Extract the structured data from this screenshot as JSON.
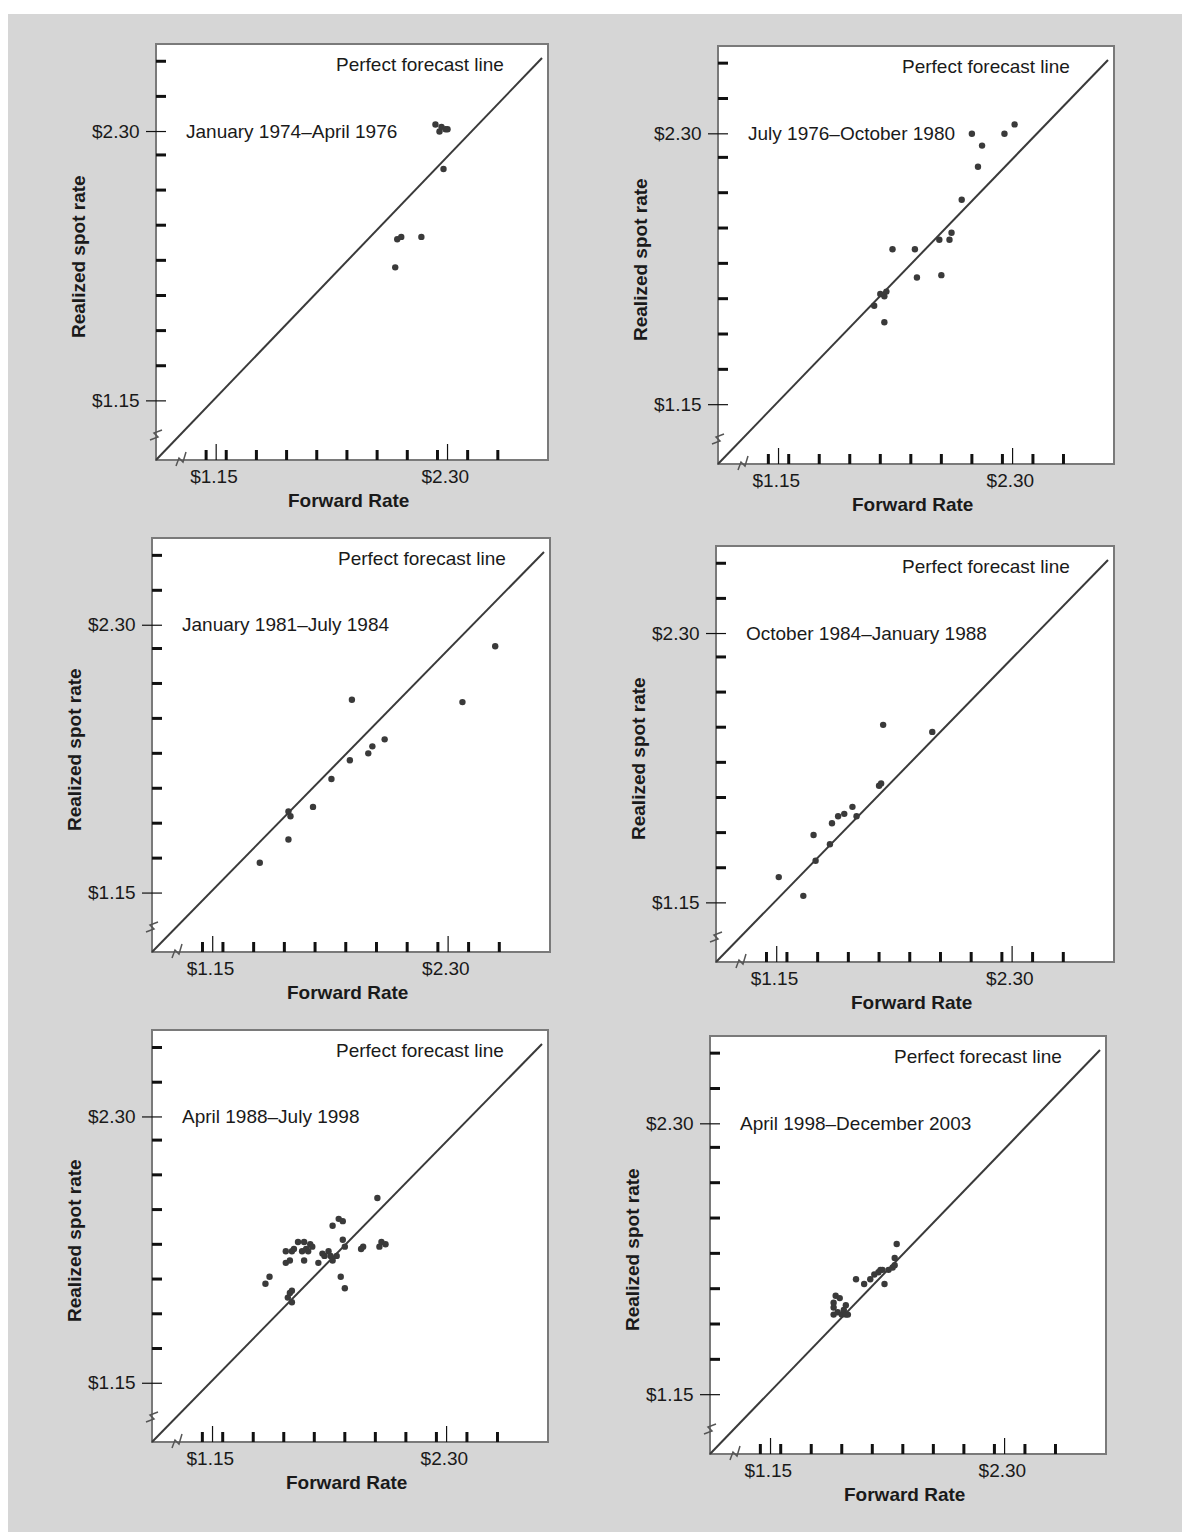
{
  "figure": {
    "background": "#d6d6d6",
    "plot_background": "#ffffff",
    "line_color": "#3a3a3a",
    "point_color": "#3a3a3a"
  },
  "labels": {
    "ylabel": "Realized spot rate",
    "xlabel": "Forward Rate",
    "line_label": "Perfect forecast line",
    "tick_low": "$1.15",
    "tick_high": "$2.30"
  },
  "chart_data": [
    {
      "type": "scatter",
      "title": "January 1974–April 1976",
      "xlabel": "Forward Rate",
      "ylabel": "Realized spot rate",
      "xticks": [
        "$1.15",
        "$2.30"
      ],
      "yticks": [
        "$1.15",
        "$2.30"
      ],
      "xlim": [
        0.9,
        2.8
      ],
      "ylim": [
        0.9,
        2.6
      ],
      "reference_line": {
        "label": "Perfect forecast line",
        "slope": 1,
        "intercept": 0
      },
      "points": [
        [
          2.04,
          1.72
        ],
        [
          2.05,
          1.84
        ],
        [
          2.07,
          1.85
        ],
        [
          2.17,
          1.85
        ],
        [
          2.24,
          2.33
        ],
        [
          2.26,
          2.3
        ],
        [
          2.27,
          2.32
        ],
        [
          2.29,
          2.31
        ],
        [
          2.3,
          2.31
        ],
        [
          2.28,
          2.14
        ]
      ]
    },
    {
      "type": "scatter",
      "title": "July 1976–October 1980",
      "xlabel": "Forward Rate",
      "ylabel": "Realized spot rate",
      "xticks": [
        "$1.15",
        "$2.30"
      ],
      "yticks": [
        "$1.15",
        "$2.30"
      ],
      "xlim": [
        0.9,
        2.8
      ],
      "ylim": [
        0.9,
        2.6
      ],
      "reference_line": {
        "label": "Perfect forecast line",
        "slope": 1,
        "intercept": 0
      },
      "points": [
        [
          1.62,
          1.57
        ],
        [
          1.65,
          1.62
        ],
        [
          1.67,
          1.61
        ],
        [
          1.68,
          1.63
        ],
        [
          1.67,
          1.5
        ],
        [
          1.71,
          1.81
        ],
        [
          1.82,
          1.81
        ],
        [
          1.83,
          1.69
        ],
        [
          1.94,
          1.85
        ],
        [
          1.95,
          1.7
        ],
        [
          1.99,
          1.85
        ],
        [
          2.0,
          1.88
        ],
        [
          2.05,
          2.02
        ],
        [
          2.1,
          2.3
        ],
        [
          2.13,
          2.16
        ],
        [
          2.15,
          2.25
        ],
        [
          2.26,
          2.3
        ],
        [
          2.31,
          2.34
        ]
      ]
    },
    {
      "type": "scatter",
      "title": "January 1981–July 1984",
      "xlabel": "Forward Rate",
      "ylabel": "Realized spot rate",
      "xticks": [
        "$1.15",
        "$2.30"
      ],
      "yticks": [
        "$1.15",
        "$2.30"
      ],
      "xlim": [
        0.9,
        2.8
      ],
      "ylim": [
        0.9,
        2.6
      ],
      "reference_line": {
        "label": "Perfect forecast line",
        "slope": 1,
        "intercept": 0
      },
      "points": [
        [
          1.38,
          1.28
        ],
        [
          1.52,
          1.38
        ],
        [
          1.52,
          1.5
        ],
        [
          1.53,
          1.48
        ],
        [
          1.64,
          1.52
        ],
        [
          1.73,
          1.64
        ],
        [
          1.82,
          1.72
        ],
        [
          1.83,
          1.98
        ],
        [
          1.91,
          1.75
        ],
        [
          1.93,
          1.78
        ],
        [
          1.99,
          1.81
        ],
        [
          2.37,
          1.97
        ],
        [
          2.53,
          2.21
        ]
      ]
    },
    {
      "type": "scatter",
      "title": "October 1984–January 1988",
      "xlabel": "Forward Rate",
      "ylabel": "Realized spot rate",
      "xticks": [
        "$1.15",
        "$2.30"
      ],
      "yticks": [
        "$1.15",
        "$2.30"
      ],
      "xlim": [
        0.9,
        2.8
      ],
      "ylim": [
        0.9,
        2.6
      ],
      "reference_line": {
        "label": "Perfect forecast line",
        "slope": 1,
        "intercept": 0
      },
      "points": [
        [
          1.16,
          1.26
        ],
        [
          1.28,
          1.18
        ],
        [
          1.33,
          1.44
        ],
        [
          1.34,
          1.33
        ],
        [
          1.41,
          1.4
        ],
        [
          1.42,
          1.49
        ],
        [
          1.45,
          1.52
        ],
        [
          1.48,
          1.53
        ],
        [
          1.52,
          1.56
        ],
        [
          1.54,
          1.52
        ],
        [
          1.65,
          1.65
        ],
        [
          1.66,
          1.66
        ],
        [
          1.67,
          1.91
        ],
        [
          1.91,
          1.88
        ]
      ]
    },
    {
      "type": "scatter",
      "title": "April 1988–July 1998",
      "xlabel": "Forward Rate",
      "ylabel": "Realized spot rate",
      "xticks": [
        "$1.15",
        "$2.30"
      ],
      "yticks": [
        "$1.15",
        "$2.30"
      ],
      "xlim": [
        0.9,
        2.8
      ],
      "ylim": [
        0.9,
        2.6
      ],
      "reference_line": {
        "label": "Perfect forecast line",
        "slope": 1,
        "intercept": 0
      },
      "points": [
        [
          1.41,
          1.58
        ],
        [
          1.43,
          1.61
        ],
        [
          1.51,
          1.67
        ],
        [
          1.51,
          1.72
        ],
        [
          1.53,
          1.54
        ],
        [
          1.52,
          1.52
        ],
        [
          1.54,
          1.5
        ],
        [
          1.54,
          1.55
        ],
        [
          1.53,
          1.68
        ],
        [
          1.54,
          1.72
        ],
        [
          1.55,
          1.73
        ],
        [
          1.57,
          1.76
        ],
        [
          1.6,
          1.76
        ],
        [
          1.61,
          1.73
        ],
        [
          1.62,
          1.72
        ],
        [
          1.63,
          1.75
        ],
        [
          1.64,
          1.74
        ],
        [
          1.6,
          1.68
        ],
        [
          1.59,
          1.72
        ],
        [
          1.67,
          1.67
        ],
        [
          1.69,
          1.71
        ],
        [
          1.7,
          1.7
        ],
        [
          1.72,
          1.72
        ],
        [
          1.73,
          1.7
        ],
        [
          1.74,
          1.68
        ],
        [
          1.76,
          1.7
        ],
        [
          1.74,
          1.83
        ],
        [
          1.77,
          1.86
        ],
        [
          1.79,
          1.85
        ],
        [
          1.79,
          1.77
        ],
        [
          1.8,
          1.74
        ],
        [
          1.8,
          1.56
        ],
        [
          1.78,
          1.61
        ],
        [
          1.88,
          1.73
        ],
        [
          1.89,
          1.74
        ],
        [
          1.96,
          1.95
        ],
        [
          1.97,
          1.74
        ],
        [
          1.98,
          1.76
        ],
        [
          2.0,
          1.75
        ]
      ]
    },
    {
      "type": "scatter",
      "title": "April 1998–December 2003",
      "xlabel": "Forward Rate",
      "ylabel": "Realized spot rate",
      "xticks": [
        "$1.15",
        "$2.30"
      ],
      "yticks": [
        "$1.15",
        "$2.30"
      ],
      "xlim": [
        0.9,
        2.8
      ],
      "ylim": [
        0.9,
        2.6
      ],
      "reference_line": {
        "label": "Perfect forecast line",
        "slope": 1,
        "intercept": 0
      },
      "points": [
        [
          1.46,
          1.49
        ],
        [
          1.46,
          1.52
        ],
        [
          1.46,
          1.54
        ],
        [
          1.47,
          1.57
        ],
        [
          1.48,
          1.5
        ],
        [
          1.49,
          1.56
        ],
        [
          1.5,
          1.49
        ],
        [
          1.51,
          1.51
        ],
        [
          1.52,
          1.49
        ],
        [
          1.52,
          1.53
        ],
        [
          1.53,
          1.49
        ],
        [
          1.57,
          1.64
        ],
        [
          1.61,
          1.62
        ],
        [
          1.64,
          1.64
        ],
        [
          1.66,
          1.66
        ],
        [
          1.68,
          1.67
        ],
        [
          1.69,
          1.68
        ],
        [
          1.7,
          1.68
        ],
        [
          1.71,
          1.62
        ],
        [
          1.73,
          1.68
        ],
        [
          1.75,
          1.69
        ],
        [
          1.76,
          1.7
        ],
        [
          1.76,
          1.73
        ],
        [
          1.77,
          1.79
        ]
      ]
    }
  ]
}
